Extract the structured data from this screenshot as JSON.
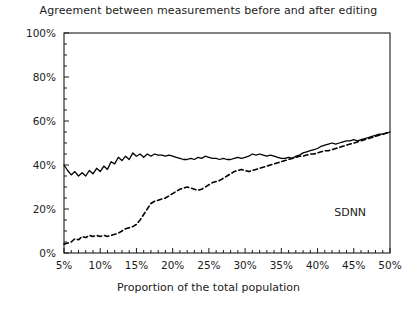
{
  "chart_data": {
    "type": "line",
    "title": "Agreement between measurements before and after editing",
    "xlabel": "Proportion of the total population",
    "ylabel": "",
    "xlim": [
      5,
      50
    ],
    "ylim": [
      0,
      100
    ],
    "xticklabels": [
      "5%",
      "10%",
      "15%",
      "20%",
      "25%",
      "30%",
      "35%",
      "40%",
      "45%",
      "50%"
    ],
    "xticks": [
      5,
      10,
      15,
      20,
      25,
      30,
      35,
      40,
      45,
      50
    ],
    "xminortick_step": 1,
    "yticklabels": [
      "0%",
      "20%",
      "40%",
      "60%",
      "80%",
      "100%"
    ],
    "yticks": [
      0,
      20,
      40,
      60,
      80,
      100
    ],
    "yminortick_step": 5,
    "grid": false,
    "legend": "none",
    "annotations": [
      {
        "text": "SDNN",
        "x": 44.5,
        "y": 17
      }
    ],
    "series": [
      {
        "name": "solid-curve",
        "style": "solid",
        "color": "#000000",
        "x": [
          5.0,
          5.5,
          6.0,
          6.5,
          7.0,
          7.5,
          8.0,
          8.5,
          9.0,
          9.5,
          10.0,
          10.5,
          11.0,
          11.5,
          12.0,
          12.5,
          13.0,
          13.5,
          14.0,
          14.5,
          15.0,
          15.5,
          16.0,
          16.5,
          17.0,
          17.5,
          18.0,
          18.5,
          19.0,
          19.5,
          20.0,
          20.5,
          21.0,
          21.5,
          22.0,
          22.5,
          23.0,
          23.5,
          24.0,
          24.5,
          25.0,
          25.5,
          26.0,
          26.5,
          27.0,
          27.5,
          28.0,
          28.5,
          29.0,
          29.5,
          30.0,
          30.5,
          31.0,
          31.5,
          32.0,
          32.5,
          33.0,
          33.5,
          34.0,
          34.5,
          35.0,
          35.5,
          36.0,
          36.5,
          37.0,
          37.5,
          38.0,
          38.5,
          39.0,
          39.5,
          40.0,
          40.5,
          41.0,
          41.5,
          42.0,
          42.5,
          43.0,
          43.5,
          44.0,
          44.5,
          45.0,
          45.5,
          46.0,
          46.5,
          47.0,
          47.5,
          48.0,
          48.5,
          49.0,
          49.5,
          50.0
        ],
        "y": [
          40.0,
          37.5,
          35.5,
          37.0,
          35.0,
          36.5,
          35.0,
          37.5,
          36.0,
          38.5,
          37.0,
          39.5,
          38.0,
          41.5,
          40.5,
          43.5,
          42.0,
          44.0,
          42.5,
          45.5,
          44.0,
          45.0,
          43.5,
          45.0,
          44.0,
          45.0,
          44.5,
          44.5,
          44.0,
          44.5,
          44.0,
          43.5,
          43.0,
          42.5,
          42.5,
          43.0,
          42.5,
          43.5,
          43.0,
          44.0,
          43.5,
          43.0,
          43.0,
          42.5,
          43.0,
          42.5,
          42.5,
          43.0,
          43.5,
          43.0,
          43.5,
          44.0,
          45.0,
          44.5,
          45.0,
          44.5,
          44.0,
          44.5,
          44.0,
          43.5,
          43.0,
          43.0,
          43.5,
          43.0,
          44.0,
          44.5,
          45.5,
          46.0,
          46.5,
          47.0,
          47.5,
          48.5,
          49.0,
          49.5,
          50.0,
          49.5,
          50.0,
          50.5,
          51.0,
          51.0,
          51.5,
          51.0,
          51.5,
          52.0,
          52.5,
          53.0,
          53.5,
          54.0,
          54.0,
          54.5,
          55.0
        ]
      },
      {
        "name": "dashed-curve",
        "style": "dashed",
        "color": "#000000",
        "x": [
          5.0,
          5.5,
          6.0,
          6.5,
          7.0,
          7.5,
          8.0,
          8.5,
          9.0,
          9.5,
          10.0,
          10.5,
          11.0,
          11.5,
          12.0,
          12.5,
          13.0,
          13.5,
          14.0,
          14.5,
          15.0,
          15.5,
          16.0,
          16.5,
          17.0,
          17.5,
          18.0,
          18.5,
          19.0,
          19.5,
          20.0,
          20.5,
          21.0,
          21.5,
          22.0,
          22.5,
          23.0,
          23.5,
          24.0,
          24.5,
          25.0,
          25.5,
          26.0,
          26.5,
          27.0,
          27.5,
          28.0,
          28.5,
          29.0,
          29.5,
          30.0,
          30.5,
          31.0,
          31.5,
          32.0,
          32.5,
          33.0,
          33.5,
          34.0,
          34.5,
          35.0,
          35.5,
          36.0,
          36.5,
          37.0,
          37.5,
          38.0,
          38.5,
          39.0,
          39.5,
          40.0,
          40.5,
          41.0,
          41.5,
          42.0,
          42.5,
          43.0,
          43.5,
          44.0,
          44.5,
          45.0,
          45.5,
          46.0,
          46.5,
          47.0,
          47.5,
          48.0,
          48.5,
          49.0,
          49.5,
          50.0
        ],
        "y": [
          4.0,
          4.5,
          5.0,
          6.5,
          6.0,
          7.5,
          7.0,
          8.0,
          7.5,
          8.0,
          7.5,
          8.0,
          7.5,
          8.0,
          8.5,
          9.0,
          10.0,
          11.0,
          11.5,
          12.0,
          13.0,
          15.0,
          17.5,
          20.0,
          22.5,
          23.5,
          24.0,
          24.5,
          25.0,
          26.0,
          27.0,
          28.0,
          29.0,
          29.5,
          30.0,
          29.5,
          29.0,
          28.5,
          29.0,
          30.0,
          31.0,
          32.0,
          32.5,
          33.0,
          34.0,
          35.0,
          36.0,
          37.0,
          37.5,
          38.0,
          37.5,
          37.0,
          37.5,
          38.0,
          38.5,
          39.0,
          39.5,
          40.0,
          40.5,
          41.0,
          41.5,
          42.0,
          42.5,
          43.0,
          43.5,
          44.0,
          44.0,
          44.5,
          45.0,
          45.0,
          45.5,
          46.0,
          46.5,
          46.5,
          47.0,
          47.5,
          48.0,
          48.5,
          49.0,
          49.5,
          50.0,
          50.5,
          51.0,
          51.5,
          52.0,
          52.5,
          53.0,
          53.5,
          54.0,
          54.5,
          55.0
        ]
      }
    ]
  }
}
